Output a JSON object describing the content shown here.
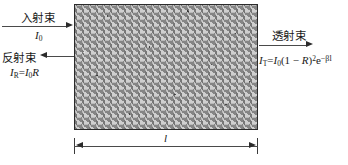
{
  "figure": {
    "medium_label": "absorbing-medium-slab",
    "beams": {
      "incident": {
        "name": "入射束",
        "intensity": {
          "symbol": "I",
          "subscript": "0"
        },
        "direction": "right"
      },
      "reflected": {
        "name": "反射束",
        "formula_parts": {
          "lhs_symbol": "I",
          "lhs_subscript": "R",
          "equals": "=",
          "rhs_symbol": "I",
          "rhs_subscript": "0",
          "rhs_factor": "R"
        },
        "direction": "left"
      },
      "transmitted": {
        "name": "透射束",
        "formula_parts": {
          "lhs_symbol": "I",
          "lhs_subscript": "T",
          "equals": "=",
          "rhs_symbol": "I",
          "rhs_subscript": "0",
          "bracket_open": "(1 − ",
          "reflectance": "R",
          "bracket_close": ")",
          "power": "2",
          "exp_base": "e",
          "exponent": "−βl"
        },
        "direction": "right"
      }
    },
    "dimension": {
      "label": "l",
      "name": "thickness-dimension"
    },
    "colors": {
      "line": "#4a4a4a",
      "arrow": "#2b2b2b",
      "slab_border": "#2b2b2b",
      "text": "#1a1a1a",
      "background": "#ffffff"
    }
  }
}
